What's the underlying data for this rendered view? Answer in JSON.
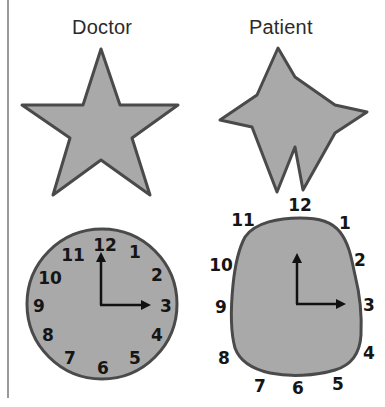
{
  "columns": [
    {
      "title": "Doctor"
    },
    {
      "title": "Patient"
    }
  ],
  "doctor": {
    "star": {
      "shape": "five-point-star"
    },
    "clock": {
      "numbers": [
        "12",
        "1",
        "2",
        "3",
        "4",
        "5",
        "6",
        "7",
        "8",
        "9",
        "10",
        "11"
      ],
      "time_shown": "3:00",
      "face": "circle"
    }
  },
  "patient": {
    "star": {
      "shape": "distorted-star"
    },
    "clock": {
      "numbers": [
        "12",
        "1",
        "2",
        "3",
        "4",
        "5",
        "6",
        "7",
        "8",
        "9",
        "10",
        "11"
      ],
      "time_shown": "3:00",
      "face": "irregular-rounded"
    }
  },
  "colors": {
    "fill": "#a9a9a9",
    "stroke": "#4a4a4a",
    "text": "#151515"
  }
}
